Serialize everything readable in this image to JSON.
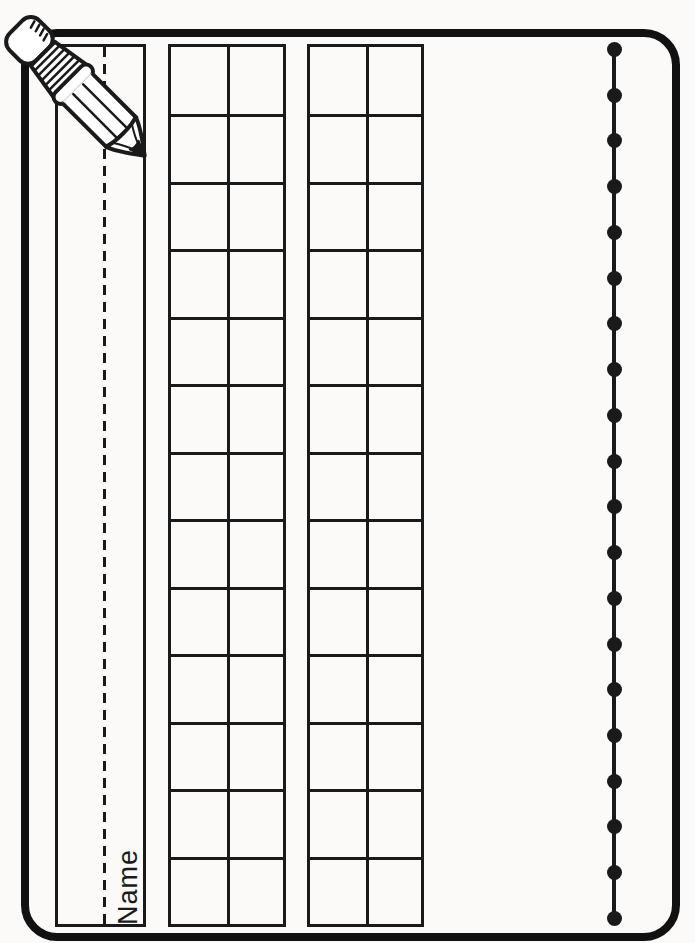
{
  "labels": {
    "name": "Name"
  },
  "grids": {
    "count": 2,
    "rows": 13,
    "columns": 2
  },
  "bead_line": {
    "dot_count": 20
  },
  "colors": {
    "ink": "#1a1a1a",
    "border": "#111111",
    "paper": "#fbfaf8"
  }
}
